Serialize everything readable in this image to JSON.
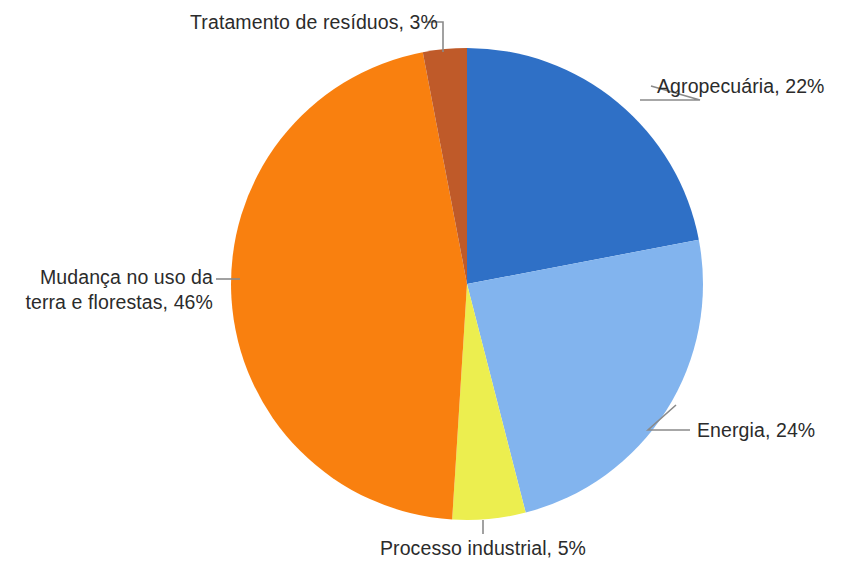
{
  "chart_data": {
    "type": "pie",
    "title": "",
    "subtitle": "",
    "xlabel": "",
    "ylabel": "",
    "legend_position": "none",
    "grid": false,
    "labels_format": "{name}, {value}%",
    "start_angle_deg": -90,
    "direction": "clockwise",
    "categories": [
      "Agropecuária",
      "Energia",
      "Processo industrial",
      "Mudança no uso da terra e florestas",
      "Tratamento de resíduos"
    ],
    "values": [
      22,
      24,
      5,
      46,
      3
    ],
    "colors": [
      "#2f70c6",
      "#82b4ee",
      "#ecee4f",
      "#f9800f",
      "#bf5a29"
    ],
    "slices": [
      {
        "name": "Agropecuária",
        "value": 22,
        "color": "#2f70c6",
        "label": "Agropecuária, 22%",
        "label_position": "right-top",
        "leader": true
      },
      {
        "name": "Energia",
        "value": 24,
        "color": "#82b4ee",
        "label": "Energia, 24%",
        "label_position": "right-bottom",
        "leader": true
      },
      {
        "name": "Processo industrial",
        "value": 5,
        "color": "#ecee4f",
        "label": "Processo industrial, 5%",
        "label_position": "bottom",
        "leader": true
      },
      {
        "name": "Mudança no uso da terra e florestas",
        "value": 46,
        "color": "#f9800f",
        "label": "Mudança no uso da\nterra e florestas, 46%",
        "label_line_1": "Mudança no uso da",
        "label_line_2": "terra e florestas, 46%",
        "label_position": "left",
        "leader": true
      },
      {
        "name": "Tratamento de resíduos",
        "value": 3,
        "color": "#bf5a29",
        "label": "Tratamento de resíduos, 3%",
        "label_position": "top-left",
        "leader": true
      }
    ]
  },
  "labels": {
    "waste": "Tratamento de resíduos, 3%",
    "agriculture": "Agropecuária, 22%",
    "energy": "Energia, 24%",
    "landuse_line1": "Mudança no uso da",
    "landuse_line2": "terra e florestas, 46%",
    "industrial": "Processo industrial, 5%"
  },
  "geometry": {
    "center_x": 467,
    "center_y": 284,
    "radius": 236
  },
  "style": {
    "background": "#ffffff",
    "leader_color": "#8a8a8a",
    "text_color": "#2b2b2b"
  }
}
